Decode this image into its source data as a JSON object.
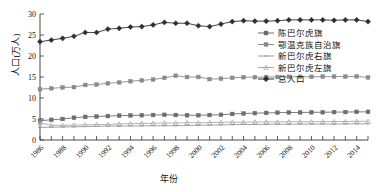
{
  "chart_data": {
    "type": "line",
    "title": "",
    "xlabel": "年份",
    "ylabel": "人口(万人)",
    "xlim": [
      1986,
      2015
    ],
    "ylim": [
      0,
      30
    ],
    "yticks": [
      0,
      5,
      10,
      15,
      20,
      25,
      30
    ],
    "grid": false,
    "legend_position": "right-top",
    "x": [
      1986,
      1987,
      1988,
      1989,
      1990,
      1991,
      1992,
      1993,
      1994,
      1995,
      1996,
      1997,
      1998,
      1999,
      2000,
      2001,
      2002,
      2003,
      2004,
      2005,
      2006,
      2007,
      2008,
      2009,
      2010,
      2011,
      2012,
      2013,
      2014,
      2015
    ],
    "xtick_labels": [
      "1986",
      "1988",
      "1990",
      "1992",
      "1994",
      "1996",
      "1998",
      "2000",
      "2002",
      "2004",
      "2006",
      "2008",
      "2010",
      "2012",
      "2014"
    ],
    "series": [
      {
        "name": "陈巴尔虎旗",
        "color": "#6d6d6d",
        "marker": "square",
        "values": [
          4.6,
          4.8,
          5.0,
          5.3,
          5.5,
          5.6,
          5.7,
          5.8,
          5.85,
          5.9,
          5.95,
          6.0,
          5.95,
          5.9,
          5.9,
          5.95,
          6.0,
          6.2,
          6.3,
          6.4,
          6.45,
          6.5,
          6.55,
          6.55,
          6.6,
          6.6,
          6.65,
          6.65,
          6.7,
          6.7
        ]
      },
      {
        "name": "鄂温克族自治旗",
        "color": "#8a8a8a",
        "marker": "square",
        "values": [
          12.1,
          12.3,
          12.5,
          12.6,
          13.1,
          13.2,
          13.5,
          13.7,
          14.0,
          14.2,
          14.4,
          14.8,
          15.3,
          15.0,
          15.0,
          14.5,
          14.6,
          14.8,
          14.95,
          14.95,
          15.0,
          15.0,
          15.05,
          15.05,
          15.05,
          15.1,
          15.1,
          15.1,
          15.15,
          14.9
        ]
      },
      {
        "name": "新巴尔虎右旗",
        "color": "#9a9a9a",
        "marker": "dash",
        "values": [
          3.0,
          3.05,
          3.1,
          3.15,
          3.2,
          3.25,
          3.3,
          3.3,
          3.35,
          3.35,
          3.4,
          3.4,
          3.4,
          3.45,
          3.5,
          3.55,
          3.6,
          3.65,
          3.7,
          3.7,
          3.72,
          3.75,
          3.75,
          3.78,
          3.8,
          3.8,
          3.8,
          3.82,
          3.85,
          3.85
        ]
      },
      {
        "name": "新巴尔虎左旗",
        "color": "#aaaaaa",
        "marker": "triangle",
        "values": [
          4.1,
          3.5,
          3.5,
          3.55,
          3.6,
          3.65,
          3.7,
          3.8,
          3.9,
          3.95,
          4.0,
          4.05,
          4.05,
          4.1,
          4.1,
          4.15,
          4.2,
          4.25,
          4.25,
          4.3,
          4.3,
          4.3,
          4.35,
          4.35,
          4.35,
          4.4,
          4.4,
          4.4,
          4.45,
          4.45
        ]
      },
      {
        "name": "总人口",
        "color": "#2f2f2f",
        "marker": "diamond",
        "values": [
          23.4,
          23.8,
          24.2,
          24.7,
          25.6,
          25.6,
          26.4,
          26.6,
          26.9,
          27.0,
          27.4,
          28.0,
          27.8,
          27.8,
          27.2,
          27.0,
          27.6,
          28.2,
          28.4,
          28.3,
          28.3,
          28.4,
          28.6,
          28.6,
          28.6,
          28.6,
          28.5,
          28.6,
          28.6,
          28.2
        ]
      }
    ]
  }
}
